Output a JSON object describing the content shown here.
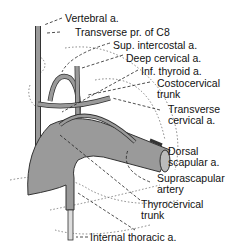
{
  "labels": {
    "vertebral": "Vertebral a.",
    "transverse_pr": "Transverse pr. of C8",
    "sup_intercostal": "Sup. intercostal a.",
    "deep_cervical": "Deep cervical a.",
    "inf_thyroid": "Inf. thyroid a.",
    "costocervical_1": "Costocervical",
    "costocervical_2": "trunk",
    "transverse_cervical_1": "Transverse",
    "transverse_cervical_2": "cervical a.",
    "dorsal_scapular_1": "Dorsal",
    "dorsal_scapular_2": "scapular a.",
    "suprascapular_1": "Suprascapular",
    "suprascapular_2": "artery",
    "thyrocervical_1": "Thyrocervical",
    "thyrocervical_2": "trunk",
    "internal_thoracic": "Internal thoracic a."
  },
  "colors": {
    "vessel": "#9a9a9a",
    "outline": "#333333"
  }
}
